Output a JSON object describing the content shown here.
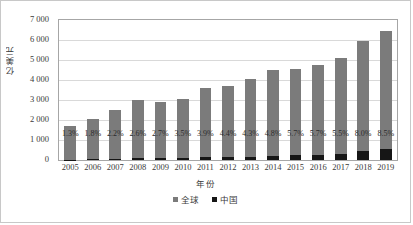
{
  "chart_data": {
    "type": "bar",
    "subtype": "stacked-column",
    "title": "",
    "xlabel": "年份",
    "ylabel": "亿美元",
    "ylim": [
      0,
      7000
    ],
    "ytick_step": 1000,
    "ytick_labels": [
      "7 000",
      "6 000",
      "5 000",
      "4 000",
      "3 000",
      "2 000",
      "1 000",
      "0"
    ],
    "ytick_values": [
      7000,
      6000,
      5000,
      4000,
      3000,
      2000,
      1000,
      0
    ],
    "grid": true,
    "legend_position": "bottom",
    "categories": [
      "2005",
      "2006",
      "2007",
      "2008",
      "2009",
      "2010",
      "2011",
      "2012",
      "2013",
      "2014",
      "2015",
      "2016",
      "2017",
      "2018",
      "2019"
    ],
    "series": [
      {
        "name": "全球",
        "color": "#7b7b7b",
        "values": [
          1700,
          2030,
          2480,
          2980,
          2870,
          3030,
          3560,
          3690,
          4020,
          4480,
          4540,
          4710,
          5080,
          5900,
          6390
        ]
      },
      {
        "name": "中国",
        "color": "#161616",
        "values": [
          22,
          37,
          55,
          77,
          78,
          106,
          139,
          162,
          173,
          215,
          259,
          269,
          279,
          472,
          543
        ]
      }
    ],
    "data_labels": [
      "1.3%",
      "1.8%",
      "2.2%",
      "2.6%",
      "2.7%",
      "3.5%",
      "3.9%",
      "4.4%",
      "4.3%",
      "4.8%",
      "5.7%",
      "5.7%",
      "5.5%",
      "8.0%",
      "8.5%"
    ],
    "data_labels_meaning": "中国占全球比例"
  },
  "legend": {
    "items": [
      {
        "label": "全球",
        "color": "#7b7b7b"
      },
      {
        "label": "中国",
        "color": "#161616"
      }
    ]
  }
}
